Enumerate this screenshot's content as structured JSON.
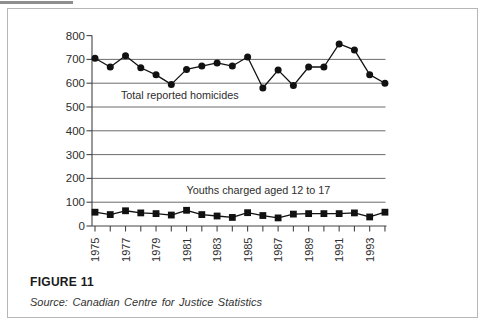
{
  "figure": {
    "caption": "FIGURE 11",
    "source": "Source: Canadian Centre for Justice Statistics"
  },
  "chart_data": {
    "type": "line",
    "title": "",
    "xlabel": "",
    "ylabel": "",
    "x": [
      1975,
      1976,
      1977,
      1978,
      1979,
      1980,
      1981,
      1982,
      1983,
      1984,
      1985,
      1986,
      1987,
      1988,
      1989,
      1990,
      1991,
      1992,
      1993,
      1994
    ],
    "x_tick_labels": [
      1975,
      1977,
      1979,
      1981,
      1983,
      1985,
      1987,
      1989,
      1991,
      1993
    ],
    "ylim": [
      0,
      800
    ],
    "ytick_step": 100,
    "grid": "horizontal",
    "legend_position": "inline-annotations",
    "series": [
      {
        "name": "Total reported homicides",
        "marker": "circle",
        "color": "#111111",
        "values": [
          705,
          668,
          715,
          665,
          635,
          595,
          658,
          672,
          685,
          672,
          710,
          580,
          655,
          590,
          668,
          668,
          765,
          740,
          636,
          600
        ]
      },
      {
        "name": "Youths charged aged 12 to 17",
        "marker": "square",
        "color": "#111111",
        "values": [
          58,
          48,
          64,
          55,
          52,
          46,
          66,
          48,
          42,
          36,
          56,
          44,
          34,
          50,
          52,
          52,
          52,
          55,
          38,
          58
        ]
      }
    ],
    "annotations": [
      {
        "text": "Total reported homicides",
        "x": 1976.7,
        "y": 534
      },
      {
        "text": "Youths charged aged 12 to 17",
        "x": 1981.0,
        "y": 134
      }
    ],
    "colors": {
      "line": "#111111",
      "grid": "#5a5a5a",
      "axis": "#444444",
      "text": "#2e2e2e"
    }
  }
}
